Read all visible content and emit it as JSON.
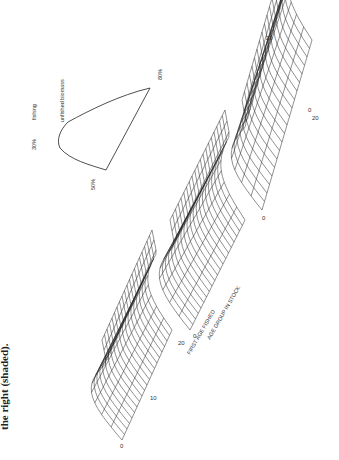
{
  "caption": "the right (shaded).",
  "figure": {
    "surfaces": [
      {
        "label": "30%",
        "suffix": "fishing"
      },
      {
        "label": "50%"
      },
      {
        "label": "80%"
      }
    ],
    "inset_label": "unfished biomass",
    "axis_first_age": "FIRST AGE FISHED",
    "axis_age_group": "AGE GROUP IN STOCK",
    "ticks": [
      "0",
      "10",
      "20"
    ]
  }
}
